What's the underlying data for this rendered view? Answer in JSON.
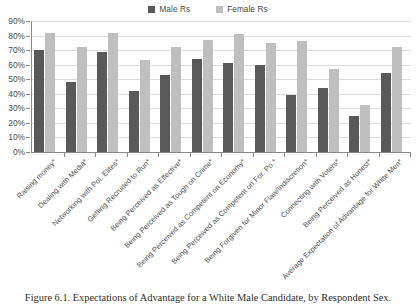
{
  "legend": {
    "position": "top-center",
    "entries": [
      {
        "label": "Male Rs",
        "color": "#595959",
        "name": "male-rs"
      },
      {
        "label": "Female Rs",
        "color": "#bfbfbf",
        "name": "female-rs"
      }
    ]
  },
  "caption": "Figure 6.1. Expectations of Advantage for a White Male Candidate, by Respondent Sex.",
  "chart_data": {
    "type": "bar",
    "title": "",
    "subtitle": "",
    "xlabel": "",
    "ylabel": "",
    "ylim": [
      0,
      0.9
    ],
    "grid": true,
    "y_tick_labels": [
      "0%",
      "10%",
      "20%",
      "30%",
      "40%",
      "50%",
      "60%",
      "70%",
      "80%",
      "90%"
    ],
    "y_tick_values": [
      0,
      10,
      20,
      30,
      40,
      50,
      60,
      70,
      80,
      90
    ],
    "legend_position": "top-center",
    "categories": [
      "Raising money*",
      "Dealing with Media*",
      "Networking with Pol. Elites*",
      "Getting Recruited to Run*",
      "Being Perceived as Effective*",
      "Being Perceived as Tough on Crime*",
      "Being Perceived as Competent on Economy*",
      "Being Perceived as Competent on For. Po.*",
      "Being Forgiven for Minor Flaw/Indiscretion*",
      "Connecting with Voters*",
      "Being Perceived as Honest*",
      "Average Expectation of Advantage for White Men*"
    ],
    "series": [
      {
        "name": "Male Rs",
        "color": "#595959",
        "values": [
          70,
          48,
          69,
          42,
          53,
          64,
          61,
          60,
          39,
          44,
          25,
          54
        ]
      },
      {
        "name": "Female Rs",
        "color": "#bfbfbf",
        "values": [
          82,
          72,
          82,
          63,
          72,
          77,
          81,
          75,
          76,
          57,
          32,
          72
        ]
      }
    ]
  }
}
